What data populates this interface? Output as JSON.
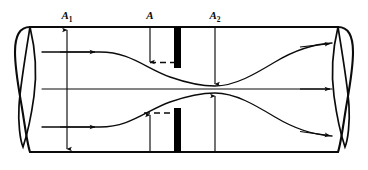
{
  "figure": {
    "background_color": "#ffffff",
    "line_color": "#0b0b0b",
    "plate_color": "#000000"
  },
  "labels": {
    "a1": {
      "base": "A",
      "subscript": "1",
      "x": 67,
      "y": 16
    },
    "a": {
      "base": "A",
      "subscript": "",
      "x": 150,
      "y": 16
    },
    "a2": {
      "base": "A",
      "subscript": "2",
      "x": 215,
      "y": 16
    }
  },
  "pipe": {
    "top_wall_y": 27,
    "bottom_wall_y": 152,
    "left_end_x": 22,
    "right_end_x": 346,
    "left_cap_label": "pipe-left-end-ellipse",
    "right_cap_label": "pipe-right-end-ellipse"
  },
  "orifice_plate": {
    "x": 174,
    "width": 7,
    "upper_segment": {
      "y_top": 27,
      "y_bottom": 68
    },
    "lower_segment": {
      "y_top": 108,
      "y_bottom": 152
    },
    "aperture_height": 40
  },
  "dimension_arrows": [
    {
      "name": "a1-dimension-arrow",
      "label_ref": "a1",
      "style": "double-headed",
      "x": 67,
      "y_start": 27,
      "y_end": 152
    },
    {
      "name": "a-dimension-arrow-top",
      "label_ref": "a",
      "style": "single-headed-down",
      "x": 150,
      "y_start": 27,
      "y_end": 63
    },
    {
      "name": "a-dimension-arrow-bottom",
      "label_ref": "a",
      "style": "single-headed-up",
      "x": 150,
      "y_start": 152,
      "y_end": 114
    },
    {
      "name": "a2-dimension-arrow-top",
      "label_ref": "a2",
      "style": "single-headed-down",
      "x": 215,
      "y_start": 27,
      "y_end": 73
    },
    {
      "name": "a2-dimension-arrow-bottom",
      "label_ref": "a2",
      "style": "single-headed-up",
      "x": 215,
      "y_start": 152,
      "y_end": 105
    }
  ],
  "dashed_leaders": [
    {
      "name": "dashed-leader-top",
      "x1": 150,
      "x2": 176,
      "y": 63
    },
    {
      "name": "dashed-leader-bottom",
      "x1": 144,
      "x2": 176,
      "y": 113
    }
  ],
  "streamlines": [
    {
      "name": "streamline-upper",
      "path": "M 42 52 L 100 52 C 130 52 145 68 170 77 C 190 84 205 86 215 86 C 235 86 255 74 275 62 C 295 50 315 44 330 43",
      "arrows": [
        {
          "x": 92,
          "y": 52,
          "direction": "right"
        },
        {
          "x": 325,
          "y": 43.4,
          "direction": "right"
        }
      ]
    },
    {
      "name": "streamline-center",
      "path": "M 42 89 L 330 89",
      "arrows": [
        {
          "x": 325,
          "y": 89,
          "direction": "right"
        }
      ]
    },
    {
      "name": "streamline-lower",
      "path": "M 42 127 L 100 127 C 130 127 145 111 170 102 C 190 95 205 93 215 93 C 235 93 255 105 275 117 C 295 129 315 135 330 136",
      "arrows": [
        {
          "x": 92,
          "y": 127,
          "direction": "right"
        },
        {
          "x": 325,
          "y": 135.6,
          "direction": "right"
        }
      ]
    }
  ],
  "inlet_arrows": [
    {
      "name": "inlet-arrow-upper",
      "x": 42,
      "y": 52
    },
    {
      "name": "inlet-arrow-center",
      "x": 42,
      "y": 89
    },
    {
      "name": "inlet-arrow-lower",
      "x": 42,
      "y": 127
    }
  ]
}
